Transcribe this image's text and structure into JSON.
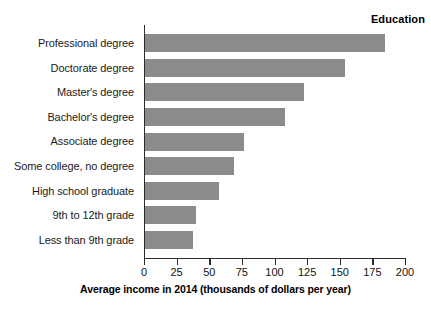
{
  "chart_data": {
    "type": "bar",
    "orientation": "horizontal",
    "title": "",
    "xlabel": "Average income in 2014 (thousands of dollars per year)",
    "ylabel": "Education",
    "categories": [
      "Professional degree",
      "Doctorate degree",
      "Master's degree",
      "Bachelor's degree",
      "Associate degree",
      "Some college, no degree",
      "High school graduate",
      "9th to 12th grade",
      "Less than 9th grade"
    ],
    "values": [
      184,
      153,
      122,
      107,
      76,
      68,
      57,
      39,
      37
    ],
    "xlim": [
      0,
      200
    ],
    "xticks": [
      0,
      25,
      50,
      75,
      100,
      125,
      150,
      175,
      200
    ],
    "xtick_labels": [
      "0",
      "25",
      "50",
      "75",
      "100",
      "125",
      "150",
      "175",
      "200"
    ],
    "grid": false,
    "legend": false,
    "bar_color": "#8b8b8b",
    "axis_color": "#2b2b2b"
  }
}
